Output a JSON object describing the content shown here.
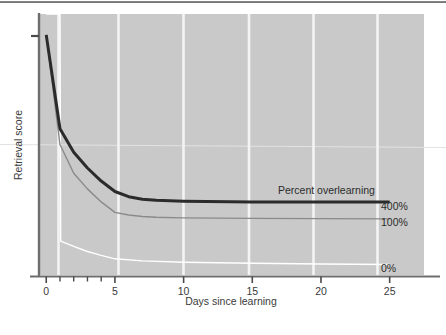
{
  "figure": {
    "background_color": "#ffffff",
    "plot_background_color": "#c9c9c9",
    "gridline_color": "#f2f2f2",
    "axis_color": "#6e6e6e",
    "top_rule_color": "#7d7d7d"
  },
  "chart_data": {
    "type": "line",
    "title": "",
    "subtitle": "",
    "xlabel": "Days since learning",
    "ylabel": "Retrieval score",
    "xlim": [
      -0.6,
      27.5
    ],
    "ylim": [
      0,
      100
    ],
    "grid": true,
    "grid_axis": "x",
    "legend_position": "right-inline",
    "legend_title": "Percent overlearning",
    "xticks": [
      0,
      5,
      10,
      15,
      20,
      25
    ],
    "xtick_labels": [
      "0",
      "5",
      "10",
      "15",
      "20",
      "25"
    ],
    "xminor_ticks": [
      1,
      2,
      3,
      4
    ],
    "yticks": [
      92
    ],
    "ytick_labels": [
      ""
    ],
    "annotations": [
      {
        "text": "Percent overlearning",
        "x": 11.5,
        "y": 36.5
      },
      {
        "text": "400%",
        "x": 25.8,
        "y": 28.0
      },
      {
        "text": "100%",
        "x": 25.8,
        "y": 21.5
      },
      {
        "text": "0%",
        "x": 25.8,
        "y": 4.0
      }
    ],
    "series": [
      {
        "name": "400%",
        "label": "400%",
        "color": "#2b2b2b",
        "line_width": 3.0,
        "x": [
          0,
          1,
          2,
          3,
          4,
          5,
          6,
          7,
          8,
          10,
          15,
          20,
          25
        ],
        "values": [
          92,
          56,
          47,
          41,
          36,
          32,
          30,
          29,
          28.6,
          28.3,
          28.0,
          28.0,
          28.0
        ]
      },
      {
        "name": "100%",
        "label": "100%",
        "color": "#8a8a8a",
        "line_width": 1.4,
        "x": [
          0,
          1,
          2,
          3,
          4,
          5,
          6,
          7,
          8,
          10,
          15,
          20,
          25
        ],
        "values": [
          92,
          50,
          39,
          33,
          28,
          24,
          23,
          22.4,
          22.1,
          21.9,
          21.7,
          21.6,
          21.5
        ]
      },
      {
        "name": "0%",
        "label": "0%",
        "color": "#ffffff",
        "line_width": 1.4,
        "x": [
          0,
          1,
          1.05,
          2,
          3,
          4,
          5,
          7,
          10,
          15,
          20,
          25
        ],
        "values": [
          100,
          100,
          13,
          11,
          9,
          7.5,
          6.2,
          5.4,
          4.9,
          4.5,
          4.2,
          4.0
        ]
      }
    ]
  }
}
